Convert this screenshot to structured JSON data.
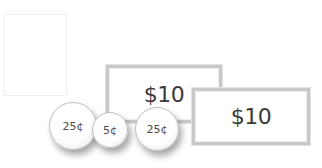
{
  "drop_area": {
    "label": ""
  },
  "bills": [
    {
      "value": "$10"
    },
    {
      "value": "$10"
    }
  ],
  "coins": [
    {
      "value": "25¢"
    },
    {
      "value": "5¢"
    },
    {
      "value": "25¢"
    }
  ]
}
